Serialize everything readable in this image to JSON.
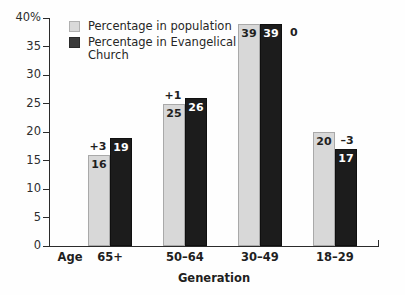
{
  "chart_data": {
    "type": "bar",
    "title": "",
    "subtitle": "",
    "xlabel": "Generation",
    "ylabel": "",
    "ylim": [
      0,
      40
    ],
    "grid": false,
    "legend_position": "top-left-inside",
    "x_axis_prefix_label": "Age",
    "categories": [
      "65+",
      "50–64",
      "30–49",
      "18–29"
    ],
    "ytick_labels": [
      "0",
      "5",
      "10",
      "15",
      "20",
      "25",
      "30",
      "35",
      "40%"
    ],
    "ytick_values": [
      0,
      5,
      10,
      15,
      20,
      25,
      30,
      35,
      40
    ],
    "series": [
      {
        "name": "Percentage in population",
        "color": "#d8d8d8",
        "values": [
          16,
          25,
          39,
          20
        ],
        "value_labels": [
          "16",
          "25",
          "39",
          "20"
        ]
      },
      {
        "name": "Percentage in Evangelical Church",
        "color": "#1c1c1c",
        "values": [
          19,
          26,
          39,
          17
        ],
        "value_labels": [
          "19",
          "26",
          "39",
          "17"
        ]
      }
    ],
    "annotations": {
      "label": "difference",
      "values": [
        3,
        1,
        0,
        -3
      ],
      "texts": [
        "+3",
        "+1",
        "0",
        "–3"
      ]
    }
  },
  "legend": {
    "items": [
      {
        "label": "Percentage in population",
        "swatch": "light"
      },
      {
        "label": "Percentage in Evangelical Church",
        "swatch": "dark"
      }
    ]
  },
  "colors": {
    "series_light": "#d8d8d8",
    "series_dark": "#1c1c1c",
    "axis": "#2b2b2b",
    "text": "#1f1f1f",
    "background": "#fefefe"
  }
}
